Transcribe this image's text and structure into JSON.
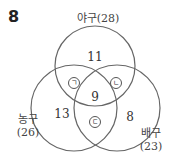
{
  "question_number": "8",
  "sets": [
    {
      "name": "야구",
      "count": "(28)",
      "label": "야구(28)"
    },
    {
      "name": "농구",
      "count": "(26)"
    },
    {
      "name": "배구",
      "count": "(23)"
    }
  ],
  "regions": {
    "baseball_only": "11",
    "basketball_only": "13",
    "volleyball_only": "8",
    "all_three": "9",
    "baseball_basketball": "ㄱ",
    "baseball_volleyball": "ㄴ",
    "basketball_volleyball": "ㄷ"
  }
}
